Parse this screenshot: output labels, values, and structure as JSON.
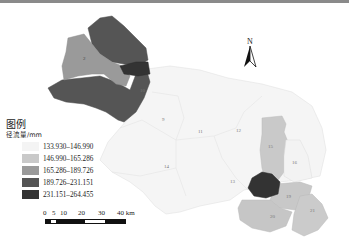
{
  "legend": {
    "title": "图例",
    "unit": "径流量/mm",
    "classes": [
      {
        "label": "133.930–146.990",
        "color": "#f4f4f4"
      },
      {
        "label": "146.990–165.286",
        "color": "#c9c9c9"
      },
      {
        "label": "165.286–189.726",
        "color": "#9a9a9a"
      },
      {
        "label": "189.726–231.151",
        "color": "#555555"
      },
      {
        "label": "231.151–264.455",
        "color": "#333333"
      }
    ]
  },
  "scale_bar": {
    "ticks": [
      "0",
      "5",
      "10",
      "20",
      "30",
      "40 km"
    ]
  },
  "north_arrow": {
    "label": "N"
  },
  "regions": [
    {
      "id": "1",
      "class": 4
    },
    {
      "id": "2",
      "class": 2
    },
    {
      "id": "3",
      "class": 4
    },
    {
      "id": "4",
      "class": 5
    },
    {
      "id": "5",
      "class": 2
    },
    {
      "id": "6",
      "class": 4
    },
    {
      "id": "7",
      "class": 4
    },
    {
      "id": "8",
      "class": 4
    },
    {
      "id": "9",
      "class": 1
    },
    {
      "id": "10",
      "class": 1
    },
    {
      "id": "11",
      "class": 1
    },
    {
      "id": "12",
      "class": 1
    },
    {
      "id": "13",
      "class": 1
    },
    {
      "id": "14",
      "class": 1
    },
    {
      "id": "15",
      "class": 2
    },
    {
      "id": "16",
      "class": 1
    },
    {
      "id": "17",
      "class": 5
    },
    {
      "id": "18",
      "class": 2
    },
    {
      "id": "19",
      "class": 2
    },
    {
      "id": "20",
      "class": 2
    },
    {
      "id": "21",
      "class": 2
    }
  ]
}
